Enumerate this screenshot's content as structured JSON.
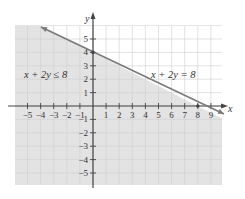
{
  "chart_data": {
    "type": "line",
    "title": "",
    "xlabel": "x",
    "ylabel": "y",
    "xlim": [
      -6,
      10
    ],
    "ylim": [
      -6,
      6
    ],
    "grid": true,
    "x_ticks": [
      -5,
      -4,
      -3,
      -2,
      -1,
      1,
      2,
      3,
      4,
      5,
      6,
      7,
      8,
      9
    ],
    "y_ticks": [
      5,
      4,
      3,
      2,
      1,
      -1,
      -2,
      -3,
      -4,
      -5
    ],
    "series": [
      {
        "name": "x + 2y = 8",
        "kind": "boundary-line",
        "style": "solid",
        "points": [
          [
            -4,
            6
          ],
          [
            0,
            4
          ],
          [
            8,
            0
          ],
          [
            9,
            -0.5
          ]
        ],
        "intercepts": {
          "x": 8,
          "y": 4
        }
      }
    ],
    "shaded_region": {
      "inequality": "x + 2y ≤ 8",
      "side": "below-left"
    },
    "annotations": [
      {
        "text": "x + 2y ≤ 8",
        "x": -3.5,
        "y": 2.5
      },
      {
        "text": "x + 2y = 8",
        "x": 6,
        "y": 2.5
      }
    ]
  },
  "labels": {
    "x_axis": "x",
    "y_axis": "y",
    "inequality": "x + 2y ≤ 8",
    "equation": "x + 2y = 8"
  },
  "colors": {
    "shade": "#e3e3e3",
    "grid": "#cfcfcf",
    "axis": "#444444",
    "line": "#7a7a7a"
  }
}
